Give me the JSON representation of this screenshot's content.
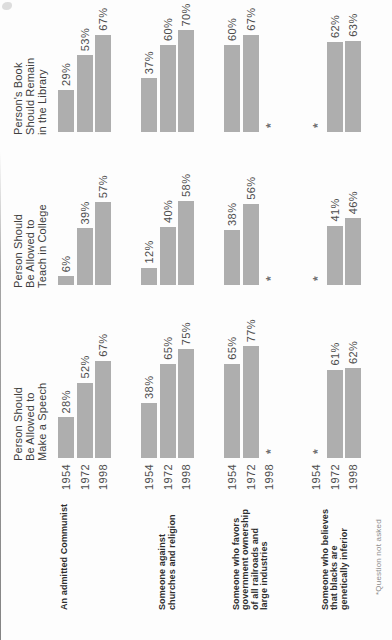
{
  "chart_data": {
    "type": "bar",
    "orientation": "horizontal bars, whole figure printed rotated 90° counterclockwise",
    "unit": "%",
    "sections": [
      {
        "id": "speech",
        "header_lines": [
          "Person Should",
          "Be Allowed to",
          "Make a Speech"
        ]
      },
      {
        "id": "teach",
        "header_lines": [
          "Person Should",
          "Be Allowed to",
          "Teach in College"
        ]
      },
      {
        "id": "library",
        "header_lines": [
          "Person's Book",
          "Should Remain",
          "in the Library"
        ]
      }
    ],
    "years": [
      "1954",
      "1972",
      "1998"
    ],
    "groups": [
      {
        "label_lines": [
          "An admitted Communist"
        ],
        "values": {
          "speech": [
            28,
            52,
            67
          ],
          "teach": [
            6,
            39,
            57
          ],
          "library": [
            29,
            53,
            67
          ]
        }
      },
      {
        "label_lines": [
          "Someone against",
          "churches and religion"
        ],
        "values": {
          "speech": [
            38,
            65,
            75
          ],
          "teach": [
            12,
            40,
            58
          ],
          "library": [
            37,
            60,
            70
          ]
        }
      },
      {
        "label_lines": [
          "Someone who favors",
          "government ownership",
          "of all railroads and",
          "large industries"
        ],
        "values": {
          "speech": [
            65,
            77,
            null
          ],
          "teach": [
            38,
            56,
            null
          ],
          "library": [
            60,
            67,
            null
          ]
        }
      },
      {
        "label_lines": [
          "Someone who believes",
          "that blacks are",
          "genetically inferior"
        ],
        "values": {
          "speech": [
            null,
            61,
            62
          ],
          "teach": [
            null,
            41,
            46
          ],
          "library": [
            null,
            62,
            63
          ]
        }
      }
    ],
    "missing_marker": "*",
    "value_suffix": "%",
    "footnote": "*Question not asked"
  },
  "colors": {
    "bar": "#aeaeae",
    "numbers": "#4c4c4c",
    "group_label": "#2d2d2d",
    "section_header": "#404040",
    "missing_marker": "#6f6f6f",
    "footnote": "#8d8d8d",
    "background": "#fdfdfd",
    "page_edge": "#8f8f8f"
  }
}
